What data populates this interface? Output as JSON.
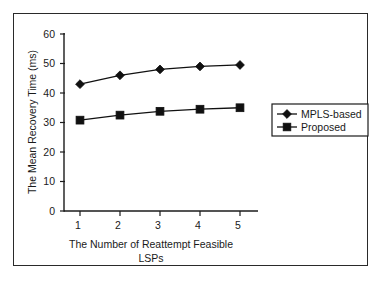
{
  "chart_data": {
    "type": "line",
    "title": "",
    "xlabel": "The Number of Reattempt Feasible LSPs",
    "xlabel_line1": "The Number of Reattempt Feasible",
    "xlabel_line2": "LSPs",
    "ylabel": "The Mean Recovery Time (ms)",
    "categories": [
      "1",
      "2",
      "3",
      "4",
      "5"
    ],
    "x": [
      1,
      2,
      3,
      4,
      5
    ],
    "xlim": [
      0.5,
      5.5
    ],
    "ylim": [
      0,
      60
    ],
    "xticks": [
      "1",
      "2",
      "3",
      "4",
      "5"
    ],
    "yticks": [
      "0",
      "10",
      "20",
      "30",
      "40",
      "50",
      "60"
    ],
    "ytick_values": [
      0,
      10,
      20,
      30,
      40,
      50,
      60
    ],
    "grid": false,
    "legend_position": "right-center",
    "series": [
      {
        "name": "MPLS-based",
        "marker": "diamond",
        "color": "#101010",
        "values": [
          43,
          46,
          48,
          49,
          49.5
        ]
      },
      {
        "name": "Proposed",
        "marker": "square",
        "color": "#101010",
        "values": [
          30.8,
          32.5,
          33.8,
          34.5,
          35
        ]
      }
    ]
  },
  "legend": {
    "entries": [
      {
        "label": "MPLS-based",
        "marker": "diamond"
      },
      {
        "label": "Proposed",
        "marker": "square"
      }
    ]
  },
  "colors": {
    "frame": "#2a2a2a",
    "axis": "#1c1c1c",
    "ink": "#101010",
    "background": "#ffffff"
  }
}
